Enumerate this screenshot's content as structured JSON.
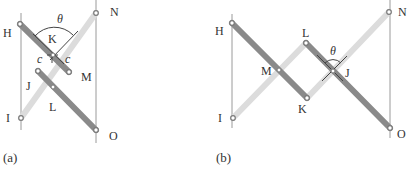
{
  "figure": {
    "colors": {
      "dark_bar": "#8a8a8a",
      "light_bar": "#dcdcdc",
      "guide_line": "#9a9a9a",
      "pivot_fill": "#ffffff",
      "pivot_stroke": "#7a7a7a",
      "angle_mark": "#444444",
      "text": "#333333"
    },
    "panels": [
      {
        "caption": "(a)",
        "labels": {
          "H": "H",
          "N": "N",
          "K": "K",
          "c_left": "c",
          "c_right": "c",
          "M": "M",
          "J": "J",
          "L": "L",
          "I": "I",
          "O": "O",
          "theta": "θ"
        }
      },
      {
        "caption": "(b)",
        "labels": {
          "H": "H",
          "N": "N",
          "L": "L",
          "theta": "θ",
          "M": "M",
          "J": "J",
          "K": "K",
          "I": "I",
          "O": "O"
        }
      }
    ]
  }
}
